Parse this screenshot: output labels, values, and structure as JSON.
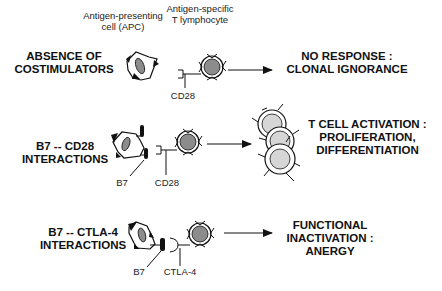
{
  "header": {
    "apc_label_line1": "Antigen-presenting",
    "apc_label_line2": "cell (APC)",
    "tcell_label_line1": "Antigen-specific",
    "tcell_label_line2": "T lymphocyte"
  },
  "rows": [
    {
      "condition_line1": "ABSENCE OF",
      "condition_line2": "COSTIMULATORS",
      "receptor_label": "CD28",
      "outcome_line1": "NO RESPONSE :",
      "outcome_line2": "CLONAL IGNORANCE"
    },
    {
      "condition_line1": "B7 -- CD28",
      "condition_line2": "INTERACTIONS",
      "ligand_label": "B7",
      "receptor_label": "CD28",
      "outcome_line1": "T CELL ACTIVATION :",
      "outcome_line2": "PROLIFERATION,",
      "outcome_line3": "DIFFERENTIATION"
    },
    {
      "condition_line1": "B7 -- CTLA-4",
      "condition_line2": "INTERACTIONS",
      "ligand_label": "B7",
      "receptor_label": "CTLA-4",
      "outcome_line1": "FUNCTIONAL",
      "outcome_line2": "INACTIVATION :",
      "outcome_line3": "ANERGY"
    }
  ],
  "colors": {
    "nucleus_fill": "#8c8c8c",
    "activated_nucleus_fill": "#d6d6d6",
    "line": "#111111"
  }
}
